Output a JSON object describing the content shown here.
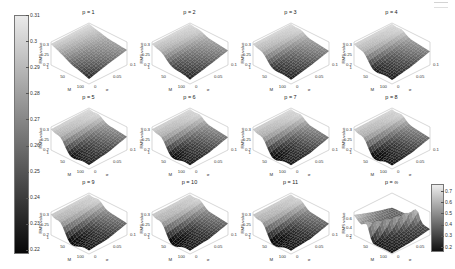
{
  "figure": {
    "background": "#ffffff",
    "ink": "#222222",
    "axis_line": "#999999"
  },
  "left_colorbar": {
    "orientation": "vertical",
    "top_color": "#eaeaea",
    "bottom_color": "#070707",
    "ticks": [
      "0.31",
      "0.3",
      "0.29",
      "0.28",
      "0.27",
      "0.26",
      "0.25",
      "0.24",
      "0.23",
      "0.22"
    ]
  },
  "right_colorbar": {
    "orientation": "vertical",
    "top_color": "#ededed",
    "bottom_color": "#101010",
    "ticks": [
      "0.7",
      "0.6",
      "0.5",
      "0.4",
      "0.3",
      "0.2"
    ]
  },
  "axes_common": {
    "zlabel": "RMS value",
    "xlabel": "M",
    "ylabel": "σ",
    "x_ticks": [
      "1",
      "50",
      "100"
    ],
    "y_ticks": [
      "0",
      "0.05",
      "0.1"
    ]
  },
  "subplots": [
    {
      "title": "p = 1",
      "z_ticks": [
        "0.3",
        "0.25",
        "0.2"
      ]
    },
    {
      "title": "p = 2",
      "z_ticks": [
        "0.3",
        "0.25",
        "0.2"
      ]
    },
    {
      "title": "p = 3",
      "z_ticks": [
        "0.3",
        "0.25",
        "0.2"
      ]
    },
    {
      "title": "p = 4",
      "z_ticks": [
        "0.3",
        "0.25",
        "0.2"
      ]
    },
    {
      "title": "p = 5",
      "z_ticks": [
        "0.3",
        "0.25",
        "0.2"
      ]
    },
    {
      "title": "p = 6",
      "z_ticks": [
        "0.3",
        "0.25",
        "0.2"
      ]
    },
    {
      "title": "p = 7",
      "z_ticks": [
        "0.3",
        "0.25",
        "0.2"
      ]
    },
    {
      "title": "p = 8",
      "z_ticks": [
        "0.3",
        "0.25",
        "0.2"
      ]
    },
    {
      "title": "p = 9",
      "z_ticks": [
        "0.3",
        "0.25",
        "0.2"
      ]
    },
    {
      "title": "p = 10",
      "z_ticks": [
        "0.3",
        "0.25",
        "0.2"
      ]
    },
    {
      "title": "p = 11",
      "z_ticks": [
        "0.3",
        "0.25",
        "0.2"
      ]
    },
    {
      "title": "p = ∞",
      "z_ticks": [
        "0.6",
        "0.4",
        "0.2"
      ]
    }
  ],
  "chart_data": [
    {
      "type": "heatmap",
      "title": "p = 1",
      "xlabel": "M",
      "ylabel": "σ",
      "zlabel": "RMS value",
      "x_values": [
        1,
        50,
        100
      ],
      "y_values": [
        0,
        0.05,
        0.1
      ],
      "zlim": [
        0.2,
        0.315
      ],
      "clim": [
        0.215,
        0.315
      ],
      "z_grid": [
        [
          0.305,
          0.308,
          0.31
        ],
        [
          0.262,
          0.272,
          0.285
        ],
        [
          0.225,
          0.252,
          0.275
        ]
      ],
      "render": {
        "ridge": 0.0,
        "valley": 0.005,
        "diag": false
      }
    },
    {
      "type": "heatmap",
      "title": "p = 2",
      "xlabel": "M",
      "ylabel": "σ",
      "zlabel": "RMS value",
      "x_values": [
        1,
        50,
        100
      ],
      "y_values": [
        0,
        0.05,
        0.1
      ],
      "zlim": [
        0.2,
        0.315
      ],
      "clim": [
        0.215,
        0.315
      ],
      "z_grid": [
        [
          0.305,
          0.308,
          0.31
        ],
        [
          0.255,
          0.268,
          0.285
        ],
        [
          0.222,
          0.246,
          0.272
        ]
      ],
      "render": {
        "ridge": 0.008,
        "valley": 0.012,
        "diag": false
      }
    },
    {
      "type": "heatmap",
      "title": "p = 3",
      "xlabel": "M",
      "ylabel": "σ",
      "zlabel": "RMS value",
      "x_values": [
        1,
        50,
        100
      ],
      "y_values": [
        0,
        0.05,
        0.1
      ],
      "zlim": [
        0.2,
        0.315
      ],
      "clim": [
        0.215,
        0.315
      ],
      "z_grid": [
        [
          0.305,
          0.308,
          0.31
        ],
        [
          0.25,
          0.263,
          0.282
        ],
        [
          0.221,
          0.242,
          0.27
        ]
      ],
      "render": {
        "ridge": 0.012,
        "valley": 0.018,
        "diag": false
      }
    },
    {
      "type": "heatmap",
      "title": "p = 4",
      "xlabel": "M",
      "ylabel": "σ",
      "zlabel": "RMS value",
      "x_values": [
        1,
        50,
        100
      ],
      "y_values": [
        0,
        0.05,
        0.1
      ],
      "zlim": [
        0.2,
        0.315
      ],
      "clim": [
        0.215,
        0.315
      ],
      "z_grid": [
        [
          0.305,
          0.307,
          0.31
        ],
        [
          0.246,
          0.259,
          0.28
        ],
        [
          0.22,
          0.239,
          0.268
        ]
      ],
      "render": {
        "ridge": 0.015,
        "valley": 0.022,
        "diag": false
      }
    },
    {
      "type": "heatmap",
      "title": "p = 5",
      "xlabel": "M",
      "ylabel": "σ",
      "zlabel": "RMS value",
      "x_values": [
        1,
        50,
        100
      ],
      "y_values": [
        0,
        0.05,
        0.1
      ],
      "zlim": [
        0.2,
        0.315
      ],
      "clim": [
        0.215,
        0.315
      ],
      "z_grid": [
        [
          0.304,
          0.307,
          0.31
        ],
        [
          0.243,
          0.256,
          0.278
        ],
        [
          0.22,
          0.236,
          0.266
        ]
      ],
      "render": {
        "ridge": 0.017,
        "valley": 0.026,
        "diag": false
      }
    },
    {
      "type": "heatmap",
      "title": "p = 6",
      "xlabel": "M",
      "ylabel": "σ",
      "zlabel": "RMS value",
      "x_values": [
        1,
        50,
        100
      ],
      "y_values": [
        0,
        0.05,
        0.1
      ],
      "zlim": [
        0.2,
        0.315
      ],
      "clim": [
        0.215,
        0.315
      ],
      "z_grid": [
        [
          0.304,
          0.306,
          0.309
        ],
        [
          0.241,
          0.253,
          0.276
        ],
        [
          0.219,
          0.234,
          0.264
        ]
      ],
      "render": {
        "ridge": 0.018,
        "valley": 0.028,
        "diag": false
      }
    },
    {
      "type": "heatmap",
      "title": "p = 7",
      "xlabel": "M",
      "ylabel": "σ",
      "zlabel": "RMS value",
      "x_values": [
        1,
        50,
        100
      ],
      "y_values": [
        0,
        0.05,
        0.1
      ],
      "zlim": [
        0.2,
        0.315
      ],
      "clim": [
        0.215,
        0.315
      ],
      "z_grid": [
        [
          0.303,
          0.306,
          0.309
        ],
        [
          0.239,
          0.251,
          0.275
        ],
        [
          0.219,
          0.232,
          0.262
        ]
      ],
      "render": {
        "ridge": 0.019,
        "valley": 0.03,
        "diag": false
      }
    },
    {
      "type": "heatmap",
      "title": "p = 8",
      "xlabel": "M",
      "ylabel": "σ",
      "zlabel": "RMS value",
      "x_values": [
        1,
        50,
        100
      ],
      "y_values": [
        0,
        0.05,
        0.1
      ],
      "zlim": [
        0.2,
        0.315
      ],
      "clim": [
        0.215,
        0.315
      ],
      "z_grid": [
        [
          0.303,
          0.305,
          0.308
        ],
        [
          0.238,
          0.249,
          0.273
        ],
        [
          0.218,
          0.231,
          0.26
        ]
      ],
      "render": {
        "ridge": 0.02,
        "valley": 0.031,
        "diag": false
      }
    },
    {
      "type": "heatmap",
      "title": "p = 9",
      "xlabel": "M",
      "ylabel": "σ",
      "zlabel": "RMS value",
      "x_values": [
        1,
        50,
        100
      ],
      "y_values": [
        0,
        0.05,
        0.1
      ],
      "zlim": [
        0.2,
        0.315
      ],
      "clim": [
        0.215,
        0.315
      ],
      "z_grid": [
        [
          0.302,
          0.305,
          0.308
        ],
        [
          0.236,
          0.247,
          0.272
        ],
        [
          0.218,
          0.229,
          0.258
        ]
      ],
      "render": {
        "ridge": 0.021,
        "valley": 0.032,
        "diag": false
      }
    },
    {
      "type": "heatmap",
      "title": "p = 10",
      "xlabel": "M",
      "ylabel": "σ",
      "zlabel": "RMS value",
      "x_values": [
        1,
        50,
        100
      ],
      "y_values": [
        0,
        0.05,
        0.1
      ],
      "zlim": [
        0.2,
        0.315
      ],
      "clim": [
        0.215,
        0.315
      ],
      "z_grid": [
        [
          0.302,
          0.304,
          0.307
        ],
        [
          0.235,
          0.246,
          0.27
        ],
        [
          0.217,
          0.228,
          0.257
        ]
      ],
      "render": {
        "ridge": 0.022,
        "valley": 0.033,
        "diag": false
      }
    },
    {
      "type": "heatmap",
      "title": "p = 11",
      "xlabel": "M",
      "ylabel": "σ",
      "zlabel": "RMS value",
      "x_values": [
        1,
        50,
        100
      ],
      "y_values": [
        0,
        0.05,
        0.1
      ],
      "zlim": [
        0.2,
        0.315
      ],
      "clim": [
        0.215,
        0.315
      ],
      "z_grid": [
        [
          0.301,
          0.304,
          0.307
        ],
        [
          0.234,
          0.245,
          0.269
        ],
        [
          0.217,
          0.227,
          0.256
        ]
      ],
      "render": {
        "ridge": 0.022,
        "valley": 0.034,
        "diag": false
      }
    },
    {
      "type": "heatmap",
      "title": "p = ∞",
      "xlabel": "M",
      "ylabel": "σ",
      "zlabel": "RMS value",
      "x_values": [
        1,
        50,
        100
      ],
      "y_values": [
        0,
        0.05,
        0.1
      ],
      "zlim": [
        0.2,
        0.75
      ],
      "clim": [
        0.2,
        0.75
      ],
      "z_grid": [
        [
          0.68,
          0.52,
          0.4
        ],
        [
          0.24,
          0.33,
          0.42
        ],
        [
          0.22,
          0.26,
          0.34
        ]
      ],
      "render": {
        "ridge": 0.26,
        "valley": 0.02,
        "diag": true
      }
    }
  ]
}
